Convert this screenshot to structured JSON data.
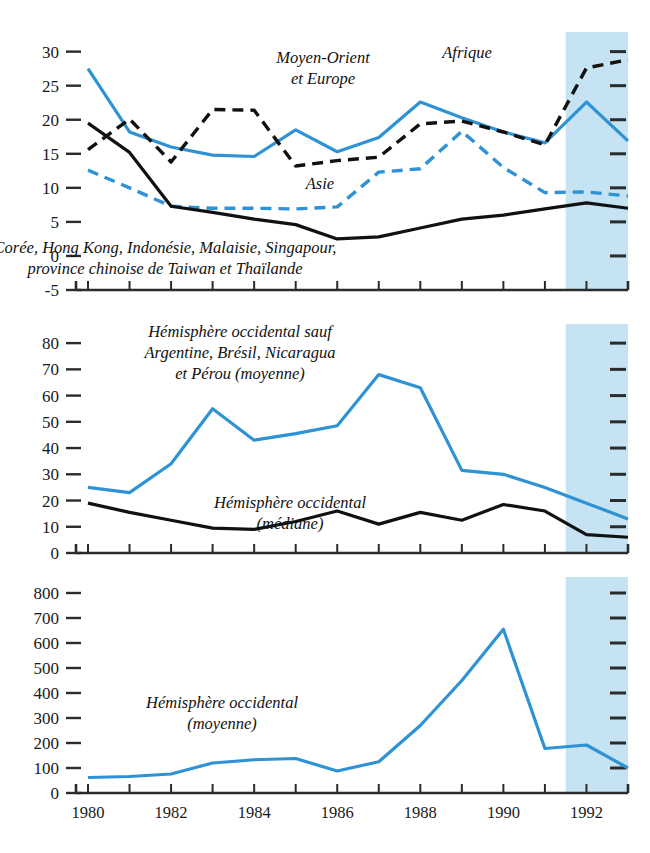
{
  "figure": {
    "width": 650,
    "height": 853,
    "colors": {
      "blue_line": "#2E92D4",
      "black_line": "#111111",
      "shade": "#C5E3F3",
      "axis": "#2b2b2b",
      "background": "#FFFFFF"
    },
    "shaded_region": {
      "from": 1991.5,
      "to": 1993.0,
      "meaning": "projection"
    }
  },
  "chart_data": [
    {
      "id": "panel-top",
      "type": "line",
      "title": "",
      "xlabel": "",
      "ylabel": "",
      "x": [
        1980,
        1981,
        1982,
        1983,
        1984,
        1985,
        1986,
        1987,
        1988,
        1989,
        1990,
        1991,
        1992,
        1993
      ],
      "xlim": [
        1980,
        1993
      ],
      "ylim": [
        -5,
        32
      ],
      "yticks": [
        -5,
        0,
        5,
        10,
        15,
        20,
        25,
        30
      ],
      "ytick_labels": [
        "-5",
        "0",
        "5",
        "10",
        "15",
        "20",
        "25",
        "30"
      ],
      "grid": false,
      "series": [
        {
          "name": "Moyen-Orient et Europe",
          "color": "#2E92D4",
          "style": "solid",
          "values": [
            27.5,
            18.2,
            16.0,
            14.8,
            14.6,
            18.5,
            15.3,
            17.4,
            22.6,
            20.3,
            18.2,
            16.6,
            22.6,
            16.9,
            17.0
          ]
        },
        {
          "name": "Afrique",
          "color": "#111111",
          "style": "dashed",
          "values": [
            15.6,
            20.1,
            13.8,
            21.5,
            21.4,
            13.2,
            14.0,
            14.5,
            19.4,
            19.8,
            18.2,
            16.3,
            27.6,
            28.8,
            19.0
          ]
        },
        {
          "name": "Asie",
          "color": "#2E92D4",
          "style": "dashed",
          "values": [
            12.6,
            10.0,
            7.3,
            7.0,
            7.0,
            6.9,
            7.2,
            12.3,
            12.8,
            18.3,
            13.0,
            9.3,
            9.4,
            8.8,
            8.7
          ]
        },
        {
          "name": "Corée, Hong Kong, Indonésie, Malaisie, Singapour, province chinoise de Taiwan et Thaïlande",
          "color": "#111111",
          "style": "solid",
          "values": [
            19.5,
            15.2,
            7.3,
            6.4,
            5.4,
            4.6,
            2.5,
            2.8,
            4.1,
            5.4,
            6.0,
            6.9,
            7.8,
            7.0,
            6.1
          ]
        }
      ],
      "annotations": [
        {
          "id": "ann-moyen-orient",
          "lines": [
            "Moyen-Orient",
            "et Europe"
          ],
          "x": 323,
          "y": 63
        },
        {
          "id": "ann-afrique",
          "lines": [
            "Afrique"
          ],
          "x": 467,
          "y": 58
        },
        {
          "id": "ann-asie",
          "lines": [
            "Asie"
          ],
          "x": 320,
          "y": 189
        },
        {
          "id": "ann-tigres",
          "lines": [
            "Corée, Hong Kong, Indonésie, Malaisie, Singapour,",
            "province chinoise de Taiwan et Thaïlande"
          ],
          "x": 165,
          "y": 253
        }
      ]
    },
    {
      "id": "panel-middle",
      "type": "line",
      "title": "",
      "xlabel": "",
      "ylabel": "",
      "x": [
        1980,
        1981,
        1982,
        1983,
        1984,
        1985,
        1986,
        1987,
        1988,
        1989,
        1990,
        1991,
        1992,
        1993
      ],
      "xlim": [
        1980,
        1993
      ],
      "ylim": [
        0,
        85
      ],
      "yticks": [
        0,
        10,
        20,
        30,
        40,
        50,
        60,
        70,
        80
      ],
      "ytick_labels": [
        "0",
        "10",
        "20",
        "30",
        "40",
        "50",
        "60",
        "70",
        "80"
      ],
      "grid": false,
      "series": [
        {
          "name": "Hémisphère occidental sauf Argentine, Brésil, Nicaragua et Pérou (moyenne)",
          "color": "#2E92D4",
          "style": "solid",
          "values": [
            25,
            23,
            34,
            55,
            43,
            45.5,
            48.5,
            68,
            63,
            31.5,
            30,
            25,
            19,
            13
          ]
        },
        {
          "name": "Hémisphère occidental (médiane)",
          "color": "#111111",
          "style": "solid",
          "values": [
            19,
            15.5,
            12.5,
            9.5,
            9,
            12,
            16,
            11,
            15.5,
            12.5,
            18.5,
            16,
            7,
            6
          ]
        }
      ],
      "annotations": [
        {
          "id": "ann-hem-occ-sauf",
          "lines": [
            "Hémisphère occidental sauf",
            "Argentine, Brésil, Nicaragua",
            "et Pérou (moyenne)"
          ],
          "x": 240,
          "y": 337
        },
        {
          "id": "ann-hem-occ-mediane",
          "lines": [
            "Hémisphère occidental",
            "(médiane)"
          ],
          "x": 290,
          "y": 508
        }
      ]
    },
    {
      "id": "panel-bottom",
      "type": "line",
      "title": "",
      "xlabel": "",
      "ylabel": "",
      "x": [
        1980,
        1981,
        1982,
        1983,
        1984,
        1985,
        1986,
        1987,
        1988,
        1989,
        1990,
        1991,
        1992,
        1993
      ],
      "xlim": [
        1980,
        1993
      ],
      "ylim": [
        0,
        840
      ],
      "yticks": [
        0,
        100,
        200,
        300,
        400,
        500,
        600,
        700,
        800
      ],
      "ytick_labels": [
        "0",
        "100",
        "200",
        "300",
        "400",
        "500",
        "600",
        "700",
        "800"
      ],
      "xticks": [
        1980,
        1981,
        1982,
        1983,
        1984,
        1985,
        1986,
        1987,
        1988,
        1989,
        1990,
        1991,
        1992,
        1993
      ],
      "xtick_labels": [
        "1980",
        "",
        "1982",
        "",
        "1984",
        "",
        "1986",
        "",
        "1988",
        "",
        "1990",
        "",
        "1992",
        ""
      ],
      "grid": false,
      "series": [
        {
          "name": "Hémisphère occidental (moyenne)",
          "color": "#2E92D4",
          "style": "solid",
          "values": [
            62,
            66,
            76,
            120,
            133,
            138,
            88,
            125,
            270,
            450,
            655,
            178,
            192,
            100
          ]
        }
      ],
      "annotations": [
        {
          "id": "ann-hem-occ-moyenne",
          "lines": [
            "Hémisphère occidental",
            "(moyenne)"
          ],
          "x": 222,
          "y": 708
        }
      ]
    }
  ],
  "axis_years": [
    "1980",
    "1982",
    "1984",
    "1986",
    "1988",
    "1990",
    "1992"
  ]
}
